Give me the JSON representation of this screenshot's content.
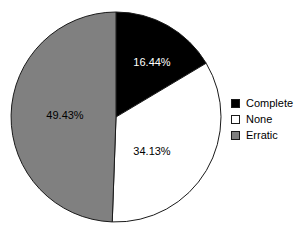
{
  "chart_data": {
    "type": "pie",
    "title": "",
    "subtitle": "",
    "xlabel": "",
    "ylabel": "",
    "grid": false,
    "legend_position": "right",
    "start_angle_deg": 0,
    "direction": "clockwise",
    "center": {
      "cx": 116,
      "cy": 117,
      "r": 105
    },
    "categories": [
      "Complete",
      "None",
      "Erratic"
    ],
    "values": [
      16.44,
      34.13,
      49.43
    ],
    "value_labels": [
      "16.44%",
      "34.13%",
      "49.43%"
    ],
    "colors": [
      "#000000",
      "#ffffff",
      "#808080"
    ],
    "slices": [
      {
        "name": "Complete",
        "value": 16.44,
        "label": "16.44%",
        "color": "#000000",
        "label_color": "#ffffff",
        "label_x": 152,
        "label_y": 66
      },
      {
        "name": "None",
        "value": 34.13,
        "label": "34.13%",
        "color": "#ffffff",
        "label_color": "#000000",
        "label_x": 152,
        "label_y": 155
      },
      {
        "name": "Erratic",
        "value": 49.43,
        "label": "49.43%",
        "color": "#808080",
        "label_color": "#000000",
        "label_x": 65,
        "label_y": 119
      }
    ]
  },
  "legend": {
    "items": [
      {
        "label": "Complete",
        "color": "#000000"
      },
      {
        "label": "None",
        "color": "#ffffff"
      },
      {
        "label": "Erratic",
        "color": "#808080"
      }
    ]
  },
  "style": {
    "outline_color": "#1a1a1a",
    "background": "#ffffff"
  }
}
